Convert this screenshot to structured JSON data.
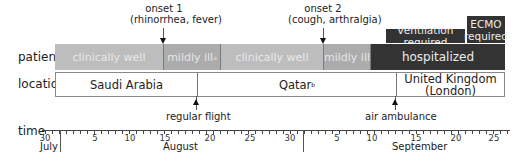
{
  "rows": {
    "patient_label": "patient",
    "location_label": "location",
    "time_label": "time"
  },
  "patient_segments": [
    {
      "label": "clinically well",
      "sup": "",
      "status": "clinically-well",
      "start_day": 30,
      "end_day": 46
    },
    {
      "label": "mildly ill",
      "sup": "a",
      "status": "mildly-ill",
      "start_day": 46,
      "end_day": 54
    },
    {
      "label": "clinically well",
      "sup": "",
      "status": "clinically-well",
      "start_day": 54,
      "end_day": 67
    },
    {
      "label": "mildly ill",
      "sup": "",
      "status": "mildly-ill",
      "start_day": 67,
      "end_day": 70
    },
    {
      "label": "hospitalized",
      "sup": "",
      "status": "hospitalized",
      "start_day": 70,
      "end_day": 89
    }
  ],
  "severity_boxes": [
    {
      "label": "ventilation required"
    },
    {
      "label_line1": "ECMO",
      "label_line2": "required"
    }
  ],
  "location_segments": [
    {
      "label": "Saudi Arabia",
      "sup": ""
    },
    {
      "label": "Qatar",
      "sup": "b"
    },
    {
      "label_line1": "United Kingdom",
      "label_line2": "(London)"
    }
  ],
  "events": {
    "onset1": {
      "line1": "onset 1",
      "line2": "(rhinorrhea, fever)"
    },
    "onset2": {
      "line1": "onset 2",
      "line2": "(cough, arthralgia)"
    },
    "flight": "regular flight",
    "ambulance": "air ambulance"
  },
  "axis": {
    "ticks": [
      {
        "label": "30",
        "x": 45
      },
      {
        "label": "5",
        "x": 95
      },
      {
        "label": "10",
        "x": 130
      },
      {
        "label": "15",
        "x": 165
      },
      {
        "label": "20",
        "x": 210
      },
      {
        "label": "25",
        "x": 250
      },
      {
        "label": "30",
        "x": 290
      },
      {
        "label": "5",
        "x": 337
      },
      {
        "label": "10",
        "x": 372
      },
      {
        "label": "15",
        "x": 416
      },
      {
        "label": "20",
        "x": 456
      },
      {
        "label": "25",
        "x": 494
      }
    ],
    "months": [
      {
        "label": "July"
      },
      {
        "label": "August"
      },
      {
        "label": "September"
      }
    ]
  },
  "colors": {
    "clinically_well": "#bdbdbd",
    "mildly_ill": "#acacac",
    "hospitalized": "#333333"
  }
}
